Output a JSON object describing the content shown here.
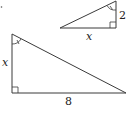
{
  "diagram": {
    "type": "similar-right-triangles",
    "small_triangle": {
      "vertices": {
        "top": [
          116,
          1
        ],
        "right_angle": [
          116,
          28
        ],
        "left": [
          60,
          28
        ]
      },
      "labels": {
        "vertical_leg": "2",
        "horizontal_leg": "x"
      },
      "angle_mark_at": "top"
    },
    "large_triangle": {
      "vertices": {
        "top": [
          12,
          34
        ],
        "right_angle": [
          12,
          93
        ],
        "right": [
          126,
          93
        ]
      },
      "labels": {
        "vertical_leg": "x",
        "horizontal_leg": "8"
      },
      "angle_mark_at": "top"
    },
    "stray_mark": "."
  },
  "colors": {
    "stroke": "#3a3a3a",
    "text": "#222222",
    "background": "#ffffff"
  }
}
